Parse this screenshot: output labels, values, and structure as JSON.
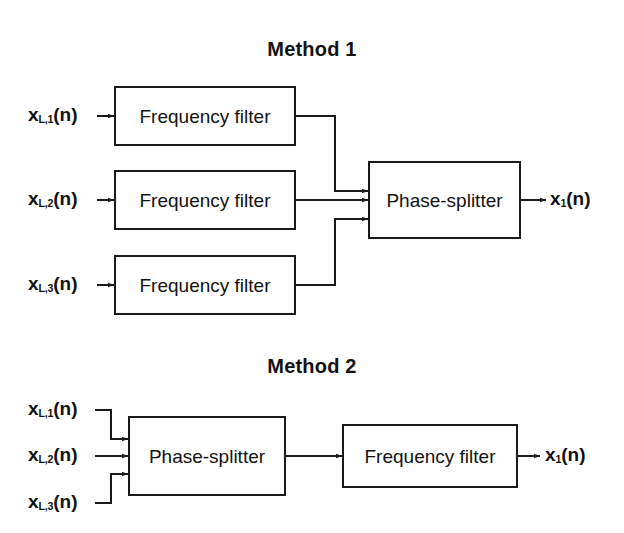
{
  "figure": {
    "background": "#ffffff",
    "ink_color": "#1a1a1a",
    "width": 624,
    "height": 533
  },
  "sections": [
    {
      "id": "method-1",
      "title": "Method 1",
      "inputs": [
        {
          "base": "x",
          "sub": "L,1",
          "arg": "(n)"
        },
        {
          "base": "x",
          "sub": "L,2",
          "arg": "(n)"
        },
        {
          "base": "x",
          "sub": "L,3",
          "arg": "(n)"
        }
      ],
      "blocks": [
        {
          "id": "m1-filter-1",
          "label": "Frequency filter"
        },
        {
          "id": "m1-filter-2",
          "label": "Frequency filter"
        },
        {
          "id": "m1-filter-3",
          "label": "Frequency filter"
        },
        {
          "id": "m1-phase-splitter",
          "label": "Phase-splitter"
        }
      ],
      "output": {
        "base": "x",
        "sub": "1",
        "arg": "(n)"
      }
    },
    {
      "id": "method-2",
      "title": "Method 2",
      "inputs": [
        {
          "base": "x",
          "sub": "L,1",
          "arg": "(n)"
        },
        {
          "base": "x",
          "sub": "L,2",
          "arg": "(n)"
        },
        {
          "base": "x",
          "sub": "L,3",
          "arg": "(n)"
        }
      ],
      "blocks": [
        {
          "id": "m2-phase-splitter",
          "label": "Phase-splitter"
        },
        {
          "id": "m2-filter",
          "label": "Frequency filter"
        }
      ],
      "output": {
        "base": "x",
        "sub": "1",
        "arg": "(n)"
      }
    }
  ]
}
